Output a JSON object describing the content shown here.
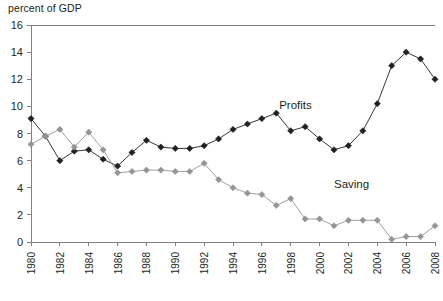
{
  "chart_data": {
    "type": "line",
    "title": "",
    "subtitle": "",
    "ylabel": "percent of GDP",
    "xlabel": "",
    "ylim": [
      0,
      16
    ],
    "xlim": [
      1980,
      2008
    ],
    "ytick_step": 2,
    "xtick_step": 2,
    "grid": false,
    "legend_position": "inline-annotation",
    "ytick_labels": [
      "0",
      "2",
      "4",
      "6",
      "8",
      "10",
      "12",
      "14",
      "16"
    ],
    "ytick_values": [
      0,
      2,
      4,
      6,
      8,
      10,
      12,
      14,
      16
    ],
    "xtick_labels": [
      "1980",
      "1982",
      "1984",
      "1986",
      "1988",
      "1990",
      "1992",
      "1994",
      "1996",
      "1998",
      "2000",
      "2002",
      "2004",
      "2006",
      "2008"
    ],
    "xtick_values": [
      1980,
      1982,
      1984,
      1986,
      1988,
      1990,
      1992,
      1994,
      1996,
      1998,
      2000,
      2002,
      2004,
      2006,
      2008
    ],
    "x": [
      1980,
      1981,
      1982,
      1983,
      1984,
      1985,
      1986,
      1987,
      1988,
      1989,
      1990,
      1991,
      1992,
      1993,
      1994,
      1995,
      1996,
      1997,
      1998,
      1999,
      2000,
      2001,
      2002,
      2003,
      2004,
      2005,
      2006,
      2007,
      2008
    ],
    "series": [
      {
        "name": "Profits",
        "color": "#231f20",
        "marker": "diamond",
        "values": [
          9.1,
          7.8,
          6.0,
          6.7,
          6.8,
          6.1,
          5.6,
          6.6,
          7.5,
          7.0,
          6.9,
          6.9,
          7.1,
          7.6,
          8.3,
          8.7,
          9.1,
          9.5,
          8.2,
          8.5,
          7.6,
          6.8,
          7.1,
          8.2,
          10.2,
          13.0,
          14.0,
          13.5,
          12.0
        ]
      },
      {
        "name": "Saving",
        "color": "#939598",
        "marker": "diamond",
        "values": [
          7.2,
          7.8,
          8.3,
          7.0,
          8.1,
          6.8,
          5.1,
          5.2,
          5.3,
          5.3,
          5.2,
          5.2,
          5.8,
          4.6,
          4.0,
          3.6,
          3.5,
          2.7,
          3.2,
          1.7,
          1.7,
          1.2,
          1.6,
          1.6,
          1.6,
          0.2,
          0.4,
          0.4,
          1.2
        ]
      }
    ],
    "annotations": [
      {
        "text": "Profits",
        "x": 1997.2,
        "y": 9.8,
        "series": "Profits"
      },
      {
        "text": "Saving",
        "x": 2001.0,
        "y": 4.0,
        "series": "Saving"
      }
    ]
  },
  "plot_geometry": {
    "left_px": 31,
    "right_px": 435,
    "top_px": 25,
    "bottom_px": 242
  }
}
